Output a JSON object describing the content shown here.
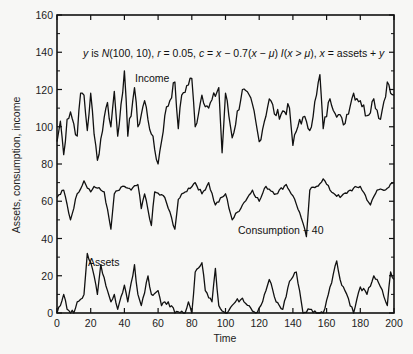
{
  "chart_data": {
    "type": "line",
    "title": "",
    "annotation": "y is N(100, 10), r = 0.05, c = x − 0.7(x − μ) I(x > μ), x = assets + y",
    "xlabel": "Time",
    "ylabel": "Assets, consumption, income",
    "xlim": [
      0,
      200
    ],
    "ylim": [
      0,
      160
    ],
    "x_ticks": [
      0,
      20,
      40,
      60,
      80,
      100,
      120,
      140,
      160,
      180,
      200
    ],
    "y_ticks": [
      0,
      20,
      40,
      60,
      80,
      100,
      120,
      140,
      160
    ],
    "grid": false,
    "legend": "inline labels",
    "series_labels": [
      {
        "name": "Income",
        "label_x": 40,
        "label_y": 123
      },
      {
        "name": "Consumption − 40",
        "label_x": 112,
        "label_y": 45
      },
      {
        "name": "Assets",
        "label_x": 22,
        "label_y": 26
      }
    ],
    "series": [
      {
        "name": "Income",
        "description": "i.i.d. N(100,10) fluctuations around 100, range approx 80–130",
        "keypoints": [
          [
            0,
            92
          ],
          [
            2,
            103
          ],
          [
            4,
            85
          ],
          [
            6,
            104
          ],
          [
            8,
            108
          ],
          [
            12,
            95
          ],
          [
            14,
            118
          ],
          [
            16,
            117
          ],
          [
            18,
            98
          ],
          [
            20,
            118
          ],
          [
            22,
            96
          ],
          [
            24,
            82
          ],
          [
            28,
            105
          ],
          [
            30,
            113
          ],
          [
            32,
            100
          ],
          [
            34,
            119
          ],
          [
            36,
            95
          ],
          [
            38,
            112
          ],
          [
            40,
            130
          ],
          [
            42,
            95
          ],
          [
            46,
            121
          ],
          [
            48,
            100
          ],
          [
            52,
            114
          ],
          [
            56,
            96
          ],
          [
            60,
            80
          ],
          [
            64,
            106
          ],
          [
            70,
            124
          ],
          [
            72,
            99
          ],
          [
            74,
            117
          ],
          [
            80,
            126
          ],
          [
            82,
            100
          ],
          [
            86,
            117
          ],
          [
            90,
            110
          ],
          [
            96,
            121
          ],
          [
            98,
            86
          ],
          [
            100,
            118
          ],
          [
            104,
            94
          ],
          [
            110,
            120
          ],
          [
            116,
            112
          ],
          [
            120,
            92
          ],
          [
            126,
            115
          ],
          [
            130,
            106
          ],
          [
            138,
            110
          ],
          [
            140,
            90
          ],
          [
            144,
            104
          ],
          [
            148,
            103
          ],
          [
            150,
            98
          ],
          [
            154,
            117
          ],
          [
            156,
            128
          ],
          [
            158,
            99
          ],
          [
            162,
            115
          ],
          [
            170,
            101
          ],
          [
            176,
            118
          ],
          [
            180,
            114
          ],
          [
            184,
            106
          ],
          [
            188,
            115
          ],
          [
            192,
            104
          ],
          [
            196,
            124
          ],
          [
            198,
            118
          ],
          [
            200,
            117
          ]
        ]
      },
      {
        "name": "Consumption − 40",
        "description": "smoothed consumption, approx 55–72 with occasional dips to ~40",
        "keypoints": [
          [
            0,
            62
          ],
          [
            4,
            66
          ],
          [
            8,
            50
          ],
          [
            12,
            64
          ],
          [
            16,
            71
          ],
          [
            20,
            65
          ],
          [
            22,
            68
          ],
          [
            28,
            65
          ],
          [
            32,
            45
          ],
          [
            34,
            64
          ],
          [
            40,
            68
          ],
          [
            44,
            66
          ],
          [
            48,
            69
          ],
          [
            50,
            56
          ],
          [
            52,
            64
          ],
          [
            56,
            47
          ],
          [
            58,
            65
          ],
          [
            64,
            62
          ],
          [
            70,
            45
          ],
          [
            72,
            61
          ],
          [
            76,
            65
          ],
          [
            82,
            70
          ],
          [
            86,
            64
          ],
          [
            90,
            70
          ],
          [
            94,
            58
          ],
          [
            100,
            64
          ],
          [
            104,
            50
          ],
          [
            110,
            58
          ],
          [
            116,
            66
          ],
          [
            120,
            60
          ],
          [
            124,
            68
          ],
          [
            130,
            64
          ],
          [
            136,
            69
          ],
          [
            140,
            63
          ],
          [
            144,
            54
          ],
          [
            148,
            41
          ],
          [
            150,
            66
          ],
          [
            154,
            68
          ],
          [
            158,
            72
          ],
          [
            162,
            66
          ],
          [
            168,
            62
          ],
          [
            174,
            66
          ],
          [
            180,
            68
          ],
          [
            186,
            58
          ],
          [
            190,
            66
          ],
          [
            196,
            67
          ],
          [
            200,
            70
          ]
        ]
      },
      {
        "name": "Assets",
        "description": "nonnegative buffer stock, approx 0–32",
        "keypoints": [
          [
            0,
            0
          ],
          [
            2,
            4
          ],
          [
            4,
            10
          ],
          [
            6,
            2
          ],
          [
            10,
            0
          ],
          [
            12,
            6
          ],
          [
            16,
            10
          ],
          [
            18,
            32
          ],
          [
            22,
            20
          ],
          [
            24,
            10
          ],
          [
            26,
            26
          ],
          [
            30,
            12
          ],
          [
            32,
            6
          ],
          [
            34,
            10
          ],
          [
            36,
            2
          ],
          [
            40,
            15
          ],
          [
            42,
            6
          ],
          [
            46,
            26
          ],
          [
            48,
            10
          ],
          [
            50,
            4
          ],
          [
            54,
            20
          ],
          [
            56,
            10
          ],
          [
            60,
            12
          ],
          [
            62,
            4
          ],
          [
            66,
            6
          ],
          [
            70,
            0
          ],
          [
            76,
            0
          ],
          [
            78,
            6
          ],
          [
            80,
            0
          ],
          [
            82,
            22
          ],
          [
            86,
            27
          ],
          [
            88,
            12
          ],
          [
            92,
            6
          ],
          [
            94,
            24
          ],
          [
            96,
            4
          ],
          [
            100,
            0
          ],
          [
            106,
            6
          ],
          [
            110,
            8
          ],
          [
            114,
            4
          ],
          [
            118,
            0
          ],
          [
            122,
            6
          ],
          [
            126,
            18
          ],
          [
            130,
            6
          ],
          [
            134,
            2
          ],
          [
            138,
            17
          ],
          [
            142,
            22
          ],
          [
            144,
            12
          ],
          [
            146,
            0
          ],
          [
            150,
            2
          ],
          [
            154,
            0
          ],
          [
            158,
            0
          ],
          [
            162,
            14
          ],
          [
            166,
            28
          ],
          [
            168,
            18
          ],
          [
            172,
            10
          ],
          [
            176,
            0
          ],
          [
            180,
            14
          ],
          [
            184,
            10
          ],
          [
            188,
            20
          ],
          [
            192,
            14
          ],
          [
            196,
            4
          ],
          [
            198,
            22
          ],
          [
            200,
            18
          ]
        ]
      }
    ]
  },
  "axis": {
    "x_title": "Time",
    "y_title": "Assets, consumption, income"
  },
  "labels": {
    "income": "Income",
    "consumption": "Consumption − 40",
    "assets": "Assets"
  },
  "annotation_parts": {
    "p1": "y",
    "p2": " is ",
    "p3": "N",
    "p4": "(100, 10), ",
    "p5": "r",
    "p6": " = 0.05, ",
    "p7": "c",
    "p8": " = ",
    "p9": "x",
    "p10": " − 0.7(",
    "p11": "x",
    "p12": " − ",
    "p13": "μ",
    "p14": ") ",
    "p15": "I",
    "p16": "(",
    "p17": "x",
    "p18": " > ",
    "p19": "μ",
    "p20": "), ",
    "p21": "x",
    "p22": " = assets + ",
    "p23": "y"
  }
}
